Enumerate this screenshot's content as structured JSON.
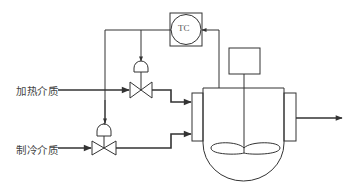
{
  "diagram": {
    "type": "process-control-schematic",
    "title": "",
    "inputs": [
      {
        "id": "heating",
        "label": "加热介质"
      },
      {
        "id": "cooling",
        "label": "制冷介质"
      }
    ],
    "controller": {
      "label": "TC"
    },
    "colors": {
      "line": "#333333",
      "text": "#444444",
      "background": "#ffffff"
    }
  }
}
